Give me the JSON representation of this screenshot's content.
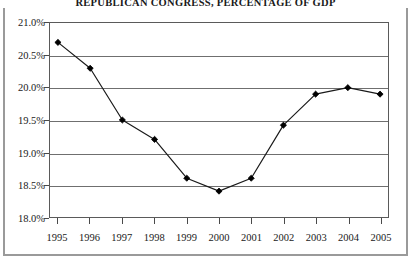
{
  "chart_data": {
    "type": "line",
    "title": "REPUBLICAN CONGRESS, PERCENTAGE OF GDP",
    "xlabel": "",
    "ylabel": "",
    "categories": [
      "1995",
      "1996",
      "1997",
      "1998",
      "1999",
      "2000",
      "2001",
      "2002",
      "2003",
      "2004",
      "2005"
    ],
    "values": [
      20.7,
      20.3,
      19.5,
      19.2,
      18.6,
      18.4,
      18.6,
      19.42,
      19.9,
      20.0,
      19.9
    ],
    "series": [
      {
        "name": "Percentage of GDP",
        "values": [
          20.7,
          20.3,
          19.5,
          19.2,
          18.6,
          18.4,
          18.6,
          19.42,
          19.9,
          20.0,
          19.9
        ]
      }
    ],
    "ylim": [
      18.0,
      21.0
    ],
    "ytick_values": [
      18.0,
      18.5,
      19.0,
      19.5,
      20.0,
      20.5,
      21.0
    ],
    "ytick_labels": [
      "18.0%",
      "18.5%",
      "19.0%",
      "19.5%",
      "20.0%",
      "20.5%",
      "21.0%"
    ],
    "xtick_labels": [
      "1995",
      "1996",
      "1997",
      "1998",
      "1999",
      "2000",
      "2001",
      "2002",
      "2003",
      "2004",
      "2005"
    ],
    "grid": "horizontal",
    "legend": "none",
    "marker": "diamond",
    "line_color": "#1a1a1a",
    "marker_color": "#000000",
    "grid_color": "#6f6f6f",
    "frame_color": "#9a9a9a",
    "background_color": "#ffffff"
  }
}
